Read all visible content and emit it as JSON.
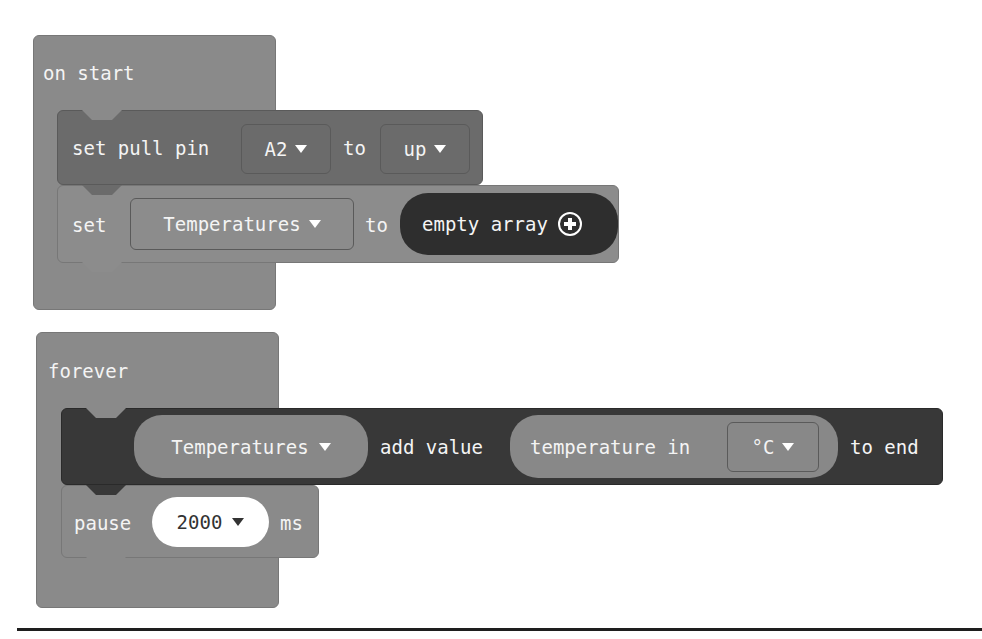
{
  "colors": {
    "hat_block": "#8a8a8a",
    "pull_pin_block": "#6b6b6b",
    "set_block": "#8c8c8c",
    "empty_array_pill": "#2e2e2e",
    "array_add_block": "#383838",
    "temperature_pill": "#888888",
    "pause_block": "#8a8a8a",
    "pause_value_bg": "#ffffff"
  },
  "on_start": {
    "label": "on start",
    "pull_pin": {
      "prefix": "set pull pin",
      "pin": "A2",
      "connector": "to",
      "mode": "up"
    },
    "set_variable": {
      "prefix": "set",
      "variable": "Temperatures",
      "connector": "to",
      "value": "empty array",
      "add_icon": "plus-circle-icon"
    }
  },
  "forever": {
    "label": "forever",
    "array_add": {
      "variable": "Temperatures",
      "action": "add value",
      "value_prefix": "temperature in",
      "unit": "°C",
      "suffix": "to end"
    },
    "pause": {
      "prefix": "pause",
      "value": "2000",
      "suffix": "ms"
    }
  }
}
